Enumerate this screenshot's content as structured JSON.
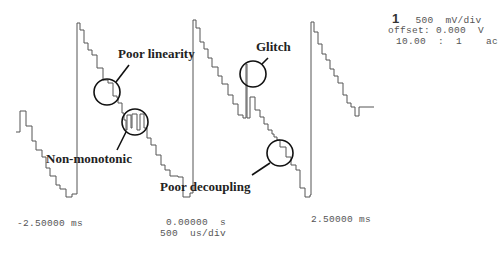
{
  "channel_info": {
    "channel_number": "1",
    "volts_per_div": "500  mV/div",
    "offset": "offset: 0.000  V",
    "probe": "10.00  :  1    ac"
  },
  "time_axis": {
    "left_label": "-2.50000 ms",
    "center_label": "0.00000  s",
    "timebase": "500  us/div",
    "right_label": "2.50000 ms"
  },
  "annotations": [
    {
      "label": "Poor linearity"
    },
    {
      "label": "Non-monotonic"
    },
    {
      "label": "Glitch"
    },
    {
      "label": "Poor decoupling"
    }
  ],
  "colors": {
    "trace": "#555555",
    "annotation": "#111111",
    "background": "#ffffff"
  }
}
